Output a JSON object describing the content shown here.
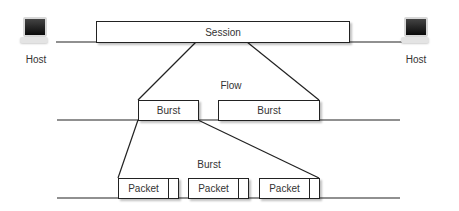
{
  "diagram": {
    "hosts": [
      {
        "label": "Host",
        "position": "left"
      },
      {
        "label": "Host",
        "position": "right"
      }
    ],
    "session": {
      "label": "Session"
    },
    "flow": {
      "label": "Flow",
      "bursts": [
        {
          "label": "Burst"
        },
        {
          "label": "Burst"
        }
      ]
    },
    "burst": {
      "label": "Burst",
      "packets": [
        {
          "label": "Packet"
        },
        {
          "label": "Packet"
        },
        {
          "label": "Packet"
        }
      ]
    },
    "colors": {
      "line": "#222222",
      "text": "#333333",
      "box_fill": "#ffffff"
    }
  }
}
